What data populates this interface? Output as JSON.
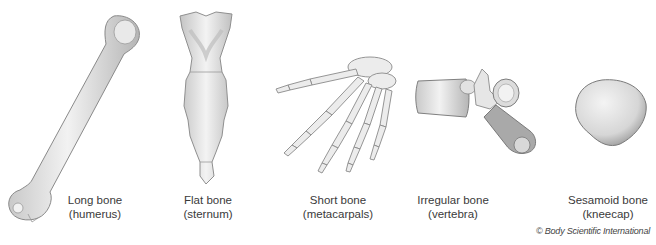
{
  "figure": {
    "background": "#ffffff",
    "items": [
      {
        "id": "long",
        "name": "Long bone",
        "example": "(humerus)"
      },
      {
        "id": "flat",
        "name": "Flat bone",
        "example": "(sternum)"
      },
      {
        "id": "short",
        "name": "Short bone",
        "example": "(metacarpals)"
      },
      {
        "id": "irregular",
        "name": "Irregular bone",
        "example": "(vertebra)"
      },
      {
        "id": "sesamoid",
        "name": "Sesamoid bone",
        "example": "(kneecap)"
      }
    ],
    "credit": "© Body Scientific International"
  }
}
